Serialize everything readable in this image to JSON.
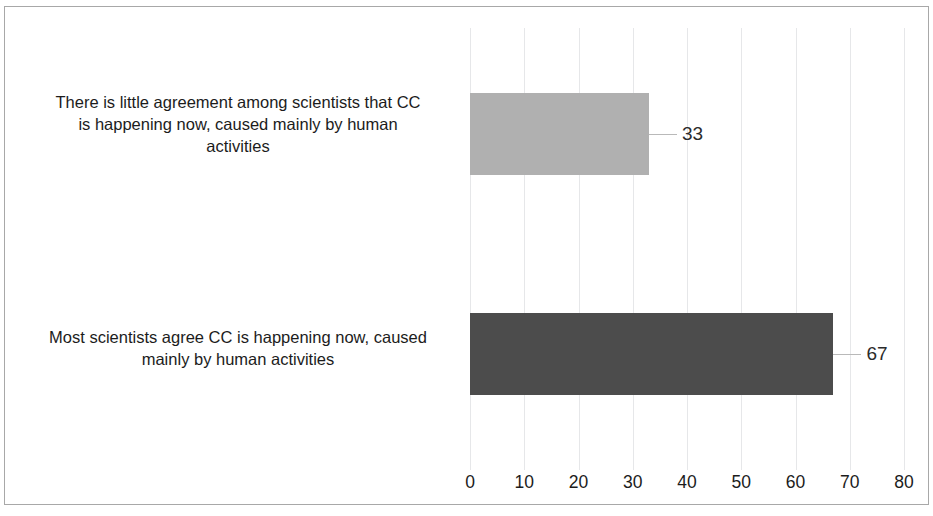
{
  "chart_data": {
    "type": "bar",
    "orientation": "horizontal",
    "title": "",
    "subtitle": "",
    "xlabel": "",
    "ylabel": "",
    "xlim": [
      0,
      80
    ],
    "x_ticks": [
      0,
      10,
      20,
      30,
      40,
      50,
      60,
      70,
      80
    ],
    "x_tick_labels": [
      "0",
      "10",
      "20",
      "30",
      "40",
      "50",
      "60",
      "70",
      "80"
    ],
    "grid": true,
    "grid_axis": "x",
    "legend": false,
    "legend_position": "none",
    "categories": [
      "There is little agreement among scientists that CC is happening now,  caused mainly by human activities",
      "Most scientists agree CC is happening now, caused mainly by human activities"
    ],
    "values": [
      33,
      67
    ],
    "data_labels": [
      "33",
      "67"
    ],
    "bar_colors": [
      "#b0b0b0",
      "#4c4c4c"
    ],
    "series": [
      {
        "name": "",
        "values": [
          33,
          67
        ]
      }
    ]
  },
  "figure": {
    "background_color": "#ffffff",
    "border_color": "#a8a8a8",
    "gridline_color": "#e6e7e9",
    "leader_line_color": "#b9b9b9",
    "text_color": "#1c1c1c"
  },
  "bars": [
    {
      "label_lines": [
        "There is little agreement among scientists that CC",
        "is happening now,  caused mainly by human",
        "activities"
      ],
      "label_text": "There is little agreement among scientists that CC is happening now,  caused mainly by human activities",
      "value": 33,
      "value_text": "33",
      "color": "#b0b0b0"
    },
    {
      "label_lines": [
        "Most scientists agree CC is happening now, caused",
        "mainly by human activities"
      ],
      "label_text": "Most scientists agree CC is happening now, caused mainly by human activities",
      "value": 67,
      "value_text": "67",
      "color": "#4c4c4c"
    }
  ],
  "axis": {
    "tick_labels": [
      "0",
      "10",
      "20",
      "30",
      "40",
      "50",
      "60",
      "70",
      "80"
    ]
  }
}
